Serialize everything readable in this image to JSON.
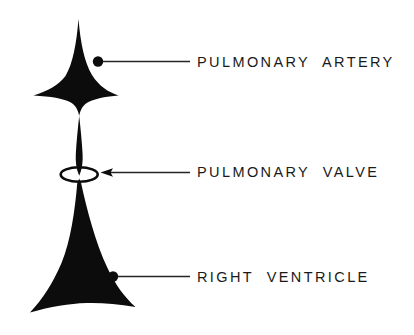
{
  "figure": {
    "background_color": "#ffffff",
    "ink_color": "#000000",
    "text_color": "#1a1a1a"
  },
  "labels": [
    {
      "id": "pulmonary-artery",
      "text": "PULMONARY  ARTERY",
      "marker": "dot",
      "leader": "plain-line"
    },
    {
      "id": "pulmonary-valve",
      "text": "PULMONARY  VALVE",
      "marker": "arrowhead",
      "leader": "arrow-line"
    },
    {
      "id": "right-ventricle",
      "text": "RIGHT  VENTRICLE",
      "marker": "dot",
      "leader": "plain-line"
    }
  ],
  "structures": [
    {
      "id": "pulmonary-artery-shape",
      "name": "pulmonary artery",
      "shape": "four-pointed-star-with-tapering-stem"
    },
    {
      "id": "pulmonary-valve-shape",
      "name": "pulmonary valve",
      "shape": "open-ellipse-ring"
    },
    {
      "id": "right-ventricle-shape",
      "name": "right ventricle",
      "shape": "flared-cone-with-concave-base"
    }
  ]
}
